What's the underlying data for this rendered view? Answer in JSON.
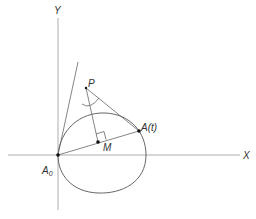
{
  "figure": {
    "colors": {
      "background": "#ffffff",
      "stroke": "#555555",
      "axis": "#888888",
      "point": "#111111",
      "text": "#333333"
    },
    "axes": {
      "x_label": "X",
      "y_label": "Y"
    },
    "points": {
      "origin": {
        "label": "A",
        "subscript": "0"
      },
      "pole": {
        "label": "P"
      },
      "moving": {
        "label": "A(t)"
      },
      "midpoint": {
        "label": "M"
      }
    }
  }
}
